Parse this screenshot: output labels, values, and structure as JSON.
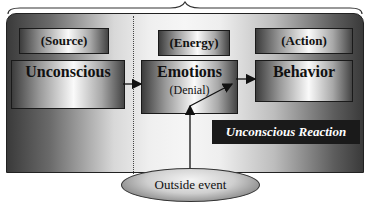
{
  "diagram": {
    "columns": [
      {
        "label": "(Source)",
        "title": "Unconscious",
        "subtitle": ""
      },
      {
        "label": "(Energy)",
        "title": "Emotions",
        "subtitle": "(Denial)"
      },
      {
        "label": "(Action)",
        "title": "Behavior",
        "subtitle": ""
      }
    ],
    "caption": "Unconscious Reaction",
    "trigger": "Outside event",
    "flows": [
      {
        "from": "Unconscious",
        "to": "Emotions"
      },
      {
        "from": "Emotions",
        "to": "Behavior"
      },
      {
        "from": "Outside event",
        "to": "Behavior",
        "via": "Emotions"
      }
    ]
  }
}
